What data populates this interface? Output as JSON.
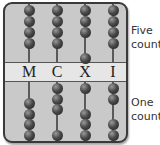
{
  "abacus": {
    "labels": [
      "M",
      "C",
      "X",
      "I"
    ],
    "rods": [
      {
        "label": "M",
        "x": 24,
        "top_beads_y": [
          6,
          17,
          28,
          39
        ],
        "bottom_beads_y": [
          99,
          110,
          120,
          131
        ]
      },
      {
        "label": "C",
        "x": 52,
        "top_beads_y": [
          6,
          17,
          28,
          39
        ],
        "bottom_beads_y": [
          84,
          95,
          105,
          131
        ]
      },
      {
        "label": "X",
        "x": 80,
        "top_beads_y": [
          6,
          17,
          28,
          54
        ],
        "bottom_beads_y": [
          84,
          110,
          120,
          131
        ]
      },
      {
        "label": "I",
        "x": 108,
        "top_beads_y": [
          6,
          17,
          28,
          39
        ],
        "bottom_beads_y": [
          84,
          95,
          120,
          131
        ]
      }
    ]
  },
  "annotations": {
    "five_counters_line1": "Five",
    "five_counters_line2": "count",
    "one_counters_line1": "One",
    "one_counters_line2": "count"
  }
}
